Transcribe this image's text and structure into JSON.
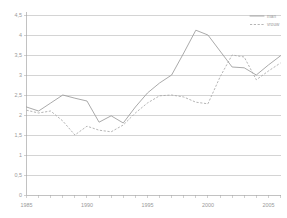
{
  "chart_data": {
    "type": "line",
    "title": "",
    "xlabel": "",
    "ylabel": "",
    "xlim": [
      1985,
      2006
    ],
    "ylim": [
      0,
      4.5
    ],
    "grid": true,
    "legend_position": "top-right",
    "x": [
      1985,
      1986,
      1987,
      1988,
      1989,
      1990,
      1991,
      1992,
      1993,
      1994,
      1995,
      1996,
      1997,
      1998,
      1999,
      2000,
      2001,
      2002,
      2003,
      2004,
      2005,
      2006
    ],
    "yticks": [
      "0",
      "0,5",
      "1",
      "1,5",
      "2",
      "2,5",
      "3",
      "3,5",
      "4",
      "4,5"
    ],
    "ytick_values": [
      0,
      0.5,
      1,
      1.5,
      2,
      2.5,
      3,
      3.5,
      4,
      4.5
    ],
    "xticks": [
      "1985",
      "1990",
      "1995",
      "2000",
      "2005"
    ],
    "xtick_values": [
      1985,
      1990,
      1995,
      2000,
      2005
    ],
    "series": [
      {
        "name": "man",
        "style": "solid",
        "color": "#9b9b9b",
        "values": [
          2.2,
          2.1,
          2.3,
          2.5,
          2.42,
          2.35,
          1.82,
          1.98,
          1.8,
          2.2,
          2.55,
          2.8,
          3.0,
          3.55,
          4.12,
          4.0,
          3.6,
          3.2,
          3.18,
          3.0,
          3.25,
          3.48
        ]
      },
      {
        "name": "vrouw",
        "style": "dashed",
        "color": "#a8a8a8",
        "values": [
          2.12,
          2.05,
          2.1,
          1.85,
          1.5,
          1.72,
          1.62,
          1.58,
          1.75,
          2.05,
          2.3,
          2.48,
          2.5,
          2.45,
          2.32,
          2.28,
          2.95,
          3.5,
          3.45,
          2.88,
          3.1,
          3.3
        ]
      }
    ]
  },
  "legend": {
    "items": [
      {
        "label": "man",
        "style": "solid"
      },
      {
        "label": "vrouw",
        "style": "dashed"
      }
    ]
  }
}
